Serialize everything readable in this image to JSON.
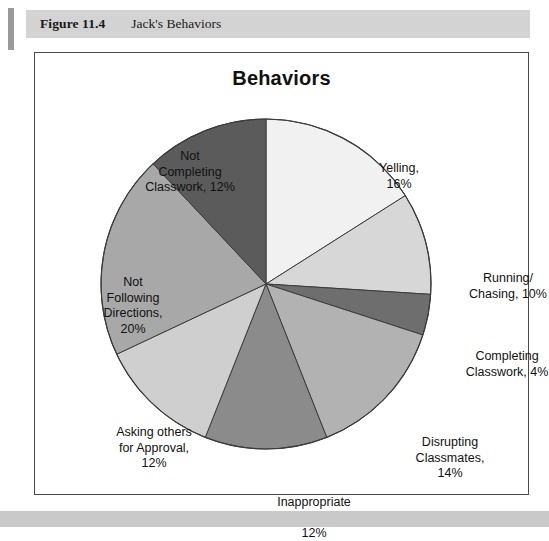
{
  "figure": {
    "number": "Figure 11.4",
    "caption": "Jack's Behaviors"
  },
  "chart_data": {
    "type": "pie",
    "title": "Behaviors",
    "xlabel": "",
    "ylabel": "",
    "legend_position": "none",
    "grid": false,
    "units": "percent",
    "total": 100,
    "start_angle_deg": 0,
    "direction": "clockwise",
    "categories": [
      "Yelling",
      "Running/Chasing",
      "Completing Classwork",
      "Disrupting Classmates",
      "Inappropriate play Behavior",
      "Asking others for Approval",
      "Not Following Directions",
      "Not Completing Classwork"
    ],
    "values": [
      16,
      10,
      4,
      14,
      12,
      12,
      20,
      12
    ],
    "colors": [
      "#f1f1f1",
      "#d7d7d7",
      "#6e6e6e",
      "#b2b2b2",
      "#8b8b8b",
      "#cfcfcf",
      "#a8a8a8",
      "#5b5b5b"
    ],
    "slice_border_color": "#3c3c3c",
    "slices": [
      {
        "label": "Yelling",
        "value": 16,
        "color": "#f1f1f1",
        "label_text": "Yelling,\n16%"
      },
      {
        "label": "Running/Chasing",
        "value": 10,
        "color": "#d7d7d7",
        "label_text": "Running/\nChasing, 10%"
      },
      {
        "label": "Completing Classwork",
        "value": 4,
        "color": "#6e6e6e",
        "label_text": "Completing\nClasswork, 4%"
      },
      {
        "label": "Disrupting Classmates",
        "value": 14,
        "color": "#b2b2b2",
        "label_text": "Disrupting\nClassmates,\n14%"
      },
      {
        "label": "Inappropriate play Behavior",
        "value": 12,
        "color": "#8b8b8b",
        "label_text": "Inappropriate\nplay Behavior,\n12%"
      },
      {
        "label": "Asking others for Approval",
        "value": 12,
        "color": "#cfcfcf",
        "label_text": "Asking others\nfor Approval,\n12%"
      },
      {
        "label": "Not Following Directions",
        "value": 20,
        "color": "#a8a8a8",
        "label_text": "Not\nFollowing\nDirections,\n20%"
      },
      {
        "label": "Not Completing Classwork",
        "value": 12,
        "color": "#5b5b5b",
        "label_text": "Not\nCompleting\nClasswork, 12%"
      }
    ]
  }
}
